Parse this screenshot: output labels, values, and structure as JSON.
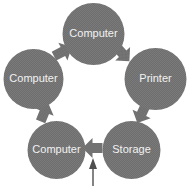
{
  "diagram": {
    "type": "cycle",
    "direction": "clockwise",
    "background_color": "#ffffff",
    "node_fill_color": "#6e6e6e",
    "node_texture_color": "#7d7d7d",
    "node_label_color": "#f2f2f2",
    "arrow_color": "#6e6e6e",
    "input_arrow_color": "#5a5a5a",
    "nodes": [
      {
        "id": "node-top",
        "label": "Computer",
        "position": "top",
        "cx": 93.5,
        "cy": 34,
        "r": 31
      },
      {
        "id": "node-right",
        "label": "Printer",
        "position": "right",
        "cx": 155.5,
        "cy": 79,
        "r": 31
      },
      {
        "id": "node-bottom-right",
        "label": "Storage",
        "position": "bottom-right",
        "cx": 131.5,
        "cy": 150,
        "r": 29
      },
      {
        "id": "node-bottom-left",
        "label": "Computer",
        "position": "bottom-left",
        "cx": 56.5,
        "cy": 150,
        "r": 29
      },
      {
        "id": "node-left",
        "label": "Computer",
        "position": "left",
        "cx": 33.5,
        "cy": 79,
        "r": 30
      }
    ],
    "arrows": [
      {
        "id": "arrow-top-to-printer",
        "from": "node-top",
        "to": "node-right",
        "direction": "down-right",
        "rotation": 45,
        "cx": 122,
        "cy": 53
      },
      {
        "id": "arrow-printer-to-storage",
        "from": "node-right",
        "to": "node-bottom-right",
        "direction": "down-left",
        "rotation": 115,
        "cx": 142,
        "cy": 113
      },
      {
        "id": "arrow-storage-to-computer",
        "from": "node-bottom-right",
        "to": "node-bottom-left",
        "direction": "left",
        "rotation": 180,
        "cx": 93.5,
        "cy": 148
      },
      {
        "id": "arrow-computer-to-left",
        "from": "node-bottom-left",
        "to": "node-left",
        "direction": "up-left",
        "rotation": 293,
        "cx": 44,
        "cy": 113
      },
      {
        "id": "arrow-left-to-top",
        "from": "node-left",
        "to": "node-top",
        "direction": "up-right",
        "rotation": 333,
        "cx": 62,
        "cy": 52
      }
    ],
    "input_arrow": {
      "id": "input-arrow",
      "label": "",
      "target": "node-bottom-left",
      "direction": "up",
      "x": 93,
      "y_start": 185,
      "y_end": 160
    }
  }
}
